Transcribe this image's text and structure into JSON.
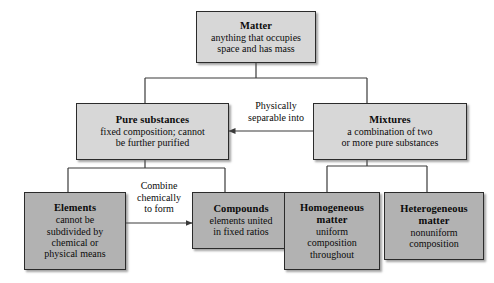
{
  "diagram": {
    "type": "flowchart",
    "background_color": "#ffffff",
    "box_fill_light": "#d7d7d7",
    "box_fill_dark": "#b2b2b2",
    "box_border_color": "#2b2b2b",
    "line_color": "#3a3a3a",
    "nodes": [
      {
        "id": "matter",
        "title": "Matter",
        "desc": "anything that occupies\nspace and has mass"
      },
      {
        "id": "pure-substances",
        "title": "Pure substances",
        "desc": "fixed composition; cannot\nbe further purified"
      },
      {
        "id": "mixtures",
        "title": "Mixtures",
        "desc": "a combination of two\nor more pure substances"
      },
      {
        "id": "elements",
        "title": "Elements",
        "desc": "cannot be\nsubdivided by\nchemical or\nphysical means"
      },
      {
        "id": "compounds",
        "title": "Compounds",
        "desc": "elements united\nin fixed ratios"
      },
      {
        "id": "homogeneous-matter",
        "title": "Homogeneous\nmatter",
        "desc": "uniform\ncomposition\nthroughout"
      },
      {
        "id": "heterogeneous-matter",
        "title": "Heterogeneous\nmatter",
        "desc": "nonuniform\ncomposition"
      }
    ],
    "edge_labels": [
      {
        "id": "physically-separable-into",
        "text": "Physically\nseparable into"
      },
      {
        "id": "combine-chemically-to-form",
        "text": "Combine\nchemically\nto form"
      }
    ]
  }
}
